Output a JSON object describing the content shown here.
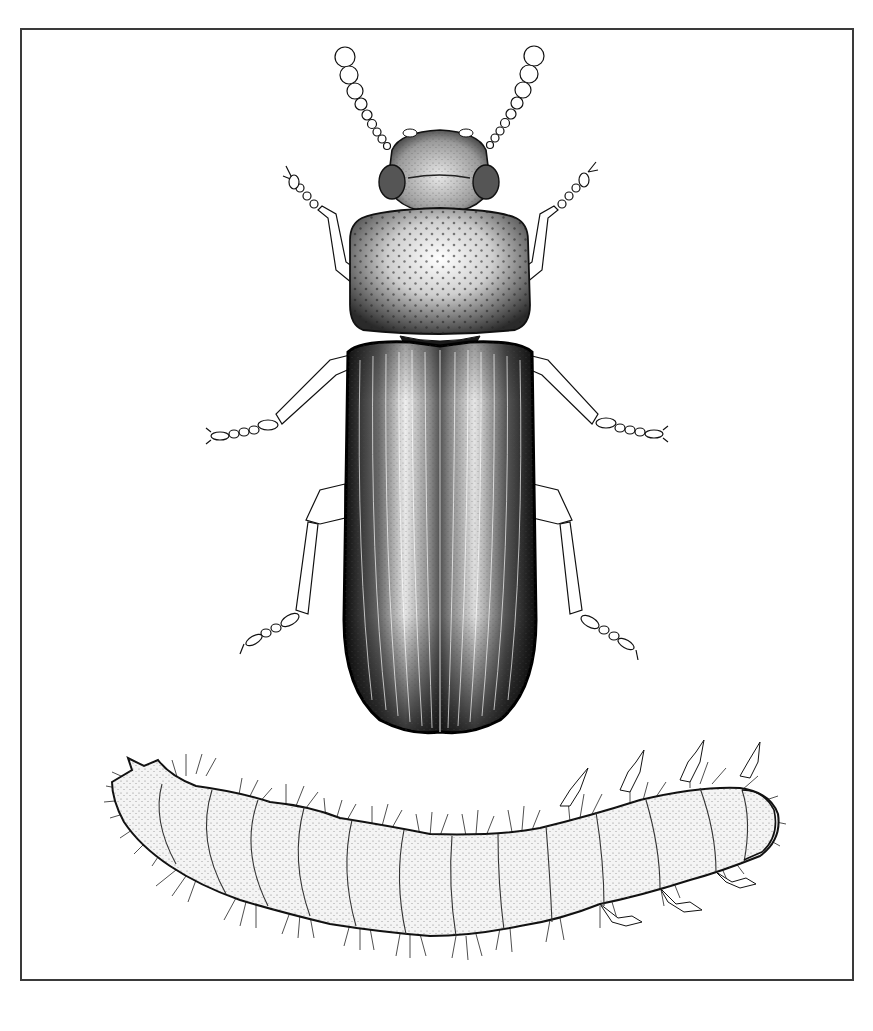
{
  "figure": {
    "colors": {
      "background": "#ffffff",
      "ink": "#111111",
      "frame": "#3a3a3a",
      "larva_fill": "#f4f4f4"
    },
    "panels": [
      {
        "name": "adult-beetle",
        "view": "dorsal",
        "parts": [
          "antennae",
          "head",
          "compound-eyes",
          "pronotum",
          "scutellum",
          "elytra",
          "legs"
        ]
      },
      {
        "name": "larva",
        "view": "lateral",
        "segments": 13,
        "parts": [
          "head-capsule",
          "thoracic-legs",
          "body-segments",
          "setae",
          "urogomphi"
        ]
      }
    ],
    "text_labels": []
  }
}
